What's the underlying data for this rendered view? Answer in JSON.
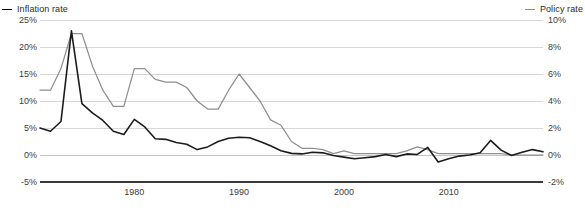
{
  "legend": {
    "left": {
      "label": "Inflation rate",
      "color": "#1c1c1c",
      "marker": "line-dash-icon"
    },
    "right": {
      "label": "Policy rate",
      "color": "#8f8f8f",
      "marker": "line-dash-icon"
    }
  },
  "chart_data": {
    "type": "line",
    "title": "",
    "xlabel": "",
    "grid": true,
    "legend_position": "top",
    "xlim": [
      1971,
      2019
    ],
    "xticks": [
      1980,
      1990,
      2000,
      2010
    ],
    "xtick_labels": [
      "1980",
      "1990",
      "2000",
      "2010"
    ],
    "left_axis": {
      "label": "Inflation rate",
      "ylim": [
        -5,
        25
      ],
      "yticks": [
        -5,
        0,
        5,
        10,
        15,
        20,
        25
      ],
      "ytick_labels": [
        "-5%",
        "0%",
        "5%",
        "10%",
        "15%",
        "20%",
        "25%"
      ]
    },
    "right_axis": {
      "label": "Policy rate",
      "ylim": [
        -2,
        10
      ],
      "yticks": [
        -2,
        0,
        2,
        4,
        6,
        8,
        10
      ],
      "ytick_labels": [
        "-2%",
        "0%",
        "2%",
        "4%",
        "6%",
        "8%",
        "10%"
      ]
    },
    "series": [
      {
        "name": "Inflation rate",
        "axis": "left",
        "color": "#1c1c1c",
        "x": [
          1971,
          1972,
          1973,
          1974,
          1975,
          1976,
          1977,
          1978,
          1979,
          1980,
          1981,
          1982,
          1983,
          1984,
          1985,
          1986,
          1987,
          1988,
          1989,
          1990,
          1991,
          1992,
          1993,
          1994,
          1995,
          1996,
          1997,
          1998,
          1999,
          2000,
          2001,
          2002,
          2003,
          2004,
          2005,
          2006,
          2007,
          2008,
          2009,
          2010,
          2011,
          2012,
          2013,
          2014,
          2015,
          2016,
          2017,
          2018,
          2019
        ],
        "values": [
          5.0,
          4.4,
          6.2,
          23.0,
          9.5,
          7.8,
          6.4,
          4.4,
          3.8,
          6.6,
          5.2,
          3.0,
          2.9,
          2.3,
          2.0,
          1.0,
          1.5,
          2.5,
          3.1,
          3.3,
          3.2,
          2.5,
          1.7,
          0.8,
          0.3,
          0.2,
          0.5,
          0.4,
          -0.1,
          -0.4,
          -0.7,
          -0.5,
          -0.3,
          0.1,
          -0.3,
          0.2,
          0.1,
          1.4,
          -1.3,
          -0.7,
          -0.2,
          0.0,
          0.4,
          2.7,
          0.9,
          -0.1,
          0.5,
          1.0,
          0.6
        ]
      },
      {
        "name": "Policy rate",
        "axis": "right",
        "color": "#8f8f8f",
        "x": [
          1971,
          1972,
          1973,
          1974,
          1975,
          1976,
          1977,
          1978,
          1979,
          1980,
          1981,
          1982,
          1983,
          1984,
          1985,
          1986,
          1987,
          1988,
          1989,
          1990,
          1991,
          1992,
          1993,
          1994,
          1995,
          1996,
          1997,
          1998,
          1999,
          2000,
          2001,
          2002,
          2003,
          2004,
          2005,
          2006,
          2007,
          2008,
          2009,
          2010,
          2011,
          2012,
          2013,
          2014,
          2015,
          2016,
          2017,
          2018,
          2019
        ],
        "values": [
          4.8,
          4.8,
          6.4,
          9.0,
          9.0,
          6.6,
          4.8,
          3.6,
          3.6,
          6.4,
          6.4,
          5.6,
          5.4,
          5.4,
          5.0,
          4.0,
          3.4,
          3.4,
          4.8,
          6.0,
          5.0,
          4.0,
          2.6,
          2.2,
          1.0,
          0.5,
          0.5,
          0.4,
          0.1,
          0.3,
          0.1,
          0.1,
          0.1,
          0.1,
          0.1,
          0.3,
          0.6,
          0.4,
          0.1,
          0.1,
          0.1,
          0.1,
          0.1,
          0.1,
          0.1,
          0.0,
          0.0,
          0.0,
          0.0
        ]
      }
    ]
  }
}
